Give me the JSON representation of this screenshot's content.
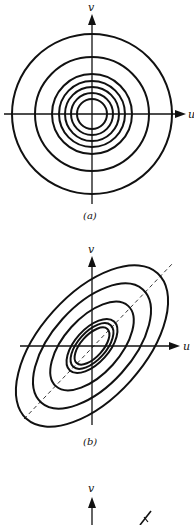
{
  "panels": [
    {
      "id": "a",
      "caption": "(a)",
      "x_label": "u",
      "y_label": "v",
      "description": "Concentric circular contours centered at origin",
      "center": [
        92,
        114
      ],
      "radii": [
        80,
        57,
        40,
        33,
        27,
        21,
        15
      ]
    },
    {
      "id": "b",
      "caption": "(b)",
      "x_label": "u",
      "y_label": "v",
      "description": "Concentric tilted elliptical contours with dashed major-axis line",
      "center": [
        92,
        346
      ],
      "rotation_deg": -48,
      "ellipses": [
        {
          "rx": 98,
          "ry": 52
        },
        {
          "rx": 76,
          "ry": 40
        },
        {
          "rx": 54,
          "ry": 28
        },
        {
          "rx": 33,
          "ry": 17
        },
        {
          "rx": 28,
          "ry": 14
        },
        {
          "rx": 23,
          "ry": 11
        }
      ]
    },
    {
      "id": "c",
      "x_label": "",
      "y_label": "v",
      "description": "Partially visible third panel"
    }
  ]
}
